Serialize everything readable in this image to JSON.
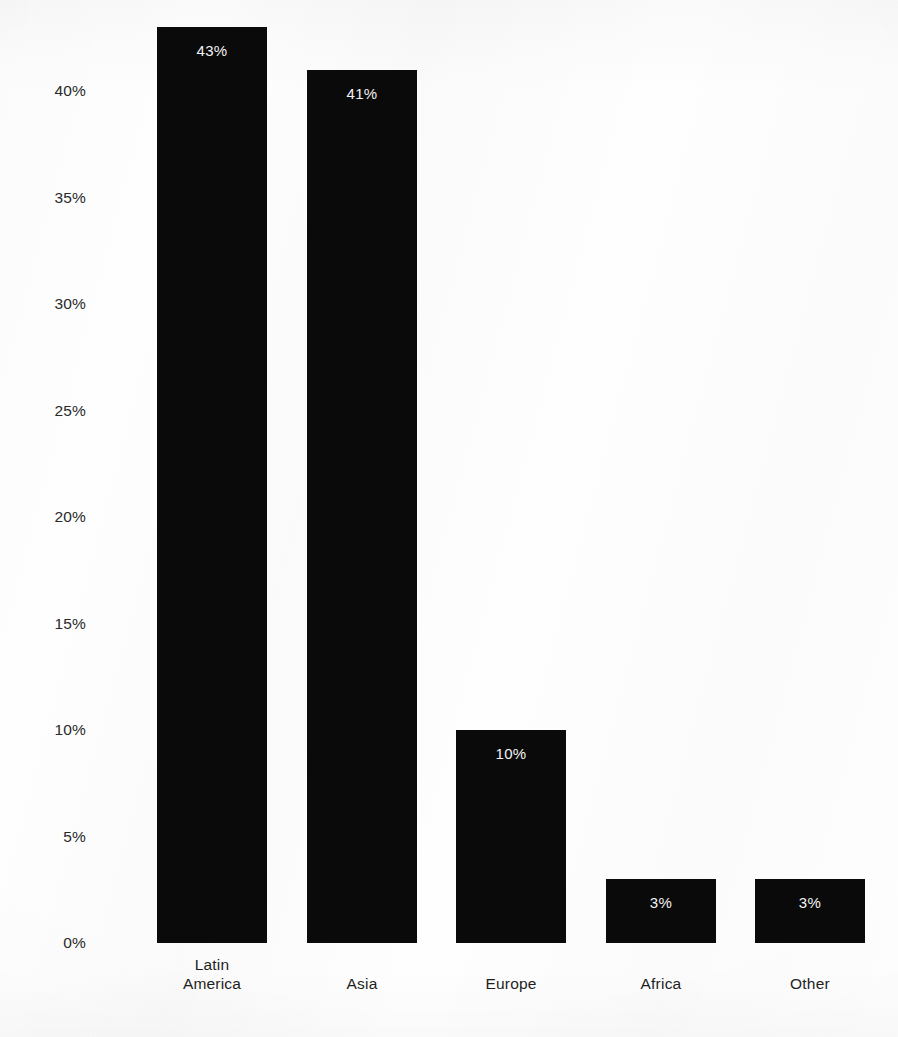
{
  "chart_data": {
    "type": "bar",
    "title": "",
    "subtitle": "",
    "xlabel": "",
    "ylabel": "",
    "categories": [
      "Latin\nAmerica",
      "Asia",
      "Europe",
      "Africa",
      "Other"
    ],
    "category_labels_flat": [
      "Latin America",
      "Asia",
      "Europe",
      "Africa",
      "Other"
    ],
    "values": [
      43,
      41,
      10,
      3,
      3
    ],
    "value_labels": [
      "43%",
      "41%",
      "10%",
      "3%",
      "3%"
    ],
    "ylim": [
      0,
      45
    ],
    "yticks": [
      0,
      5,
      10,
      15,
      20,
      25,
      30,
      35,
      40
    ],
    "ytick_labels": [
      "0%",
      "5%",
      "10%",
      "15%",
      "20%",
      "25%",
      "30%",
      "35%",
      "40%"
    ],
    "grid": false,
    "legend": null,
    "bar_color": "#0a0a0a",
    "value_label_color": "#f4f4f4",
    "axis_text_color": "#2a2a2a",
    "background_color": "#ffffff"
  },
  "axis": {
    "y_ticks": [
      {
        "label": "40%",
        "value": 40
      },
      {
        "label": "35%",
        "value": 35
      },
      {
        "label": "30%",
        "value": 30
      },
      {
        "label": "25%",
        "value": 25
      },
      {
        "label": "20%",
        "value": 20
      },
      {
        "label": "15%",
        "value": 15
      },
      {
        "label": "10%",
        "value": 10
      },
      {
        "label": "5%",
        "value": 5
      },
      {
        "label": "0%",
        "value": 0
      }
    ]
  },
  "bars": [
    {
      "name": "latin-america",
      "category": "Latin\nAmerica",
      "value": 43,
      "value_label": "43%"
    },
    {
      "name": "asia",
      "category": "Asia",
      "value": 41,
      "value_label": "41%"
    },
    {
      "name": "europe",
      "category": "Europe",
      "value": 10,
      "value_label": "10%"
    },
    {
      "name": "africa",
      "category": "Africa",
      "value": 3,
      "value_label": "3%"
    },
    {
      "name": "other",
      "category": "Other",
      "value": 3,
      "value_label": "3%"
    }
  ]
}
